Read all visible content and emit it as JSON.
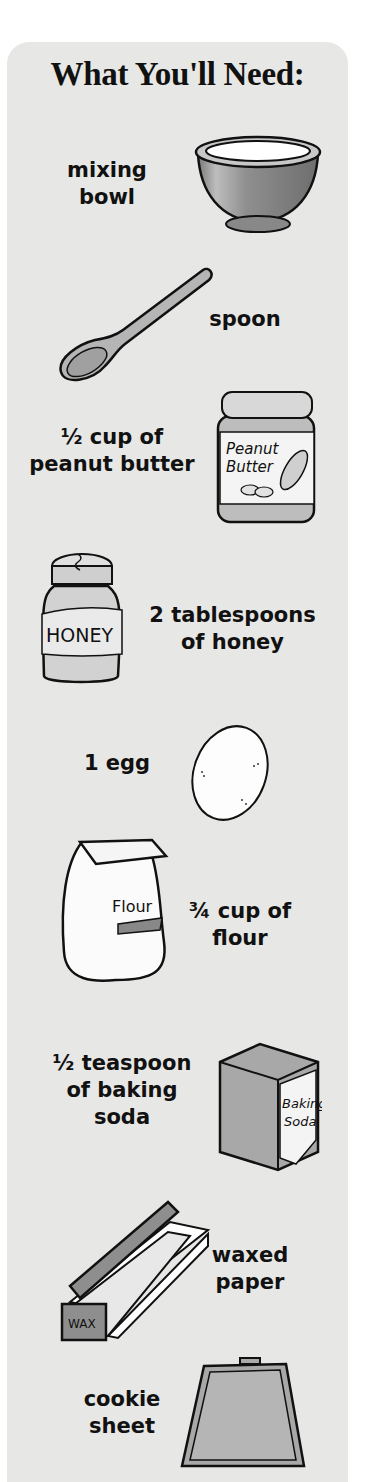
{
  "title": "What You'll Need:",
  "items": [
    {
      "label": "mixing\nbowl",
      "icon": "mixing-bowl-icon"
    },
    {
      "label": "spoon",
      "icon": "spoon-icon"
    },
    {
      "label": "½ cup of\npeanut butter",
      "icon": "peanut-butter-jar-icon",
      "jar_text": "Peanut\nButter"
    },
    {
      "label": "2 tablespoons\nof honey",
      "icon": "honey-jar-icon",
      "jar_text": "HONEY"
    },
    {
      "label": "1 egg",
      "icon": "egg-icon"
    },
    {
      "label": "¾ cup of\nflour",
      "icon": "flour-bag-icon",
      "bag_text": "Flour"
    },
    {
      "label": "½ teaspoon\nof baking\nsoda",
      "icon": "baking-soda-box-icon",
      "box_text": "Baking\nSoda"
    },
    {
      "label": "waxed\npaper",
      "icon": "waxed-paper-box-icon",
      "box_text": "WAX"
    },
    {
      "label": "cookie\nsheet",
      "icon": "cookie-sheet-icon"
    }
  ],
  "colors": {
    "panel_bg": "#e7e7e5",
    "outline": "#111111",
    "gray_fill": "#9a9a9a",
    "light_fill": "#ffffff"
  }
}
